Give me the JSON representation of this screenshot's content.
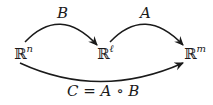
{
  "diagram": {
    "type": "commutative-diagram",
    "nodes": [
      {
        "id": "Rn",
        "base": "ℝ",
        "superscript": "n"
      },
      {
        "id": "Rl",
        "base": "ℝ",
        "superscript": "ℓ"
      },
      {
        "id": "Rm",
        "base": "ℝ",
        "superscript": "m"
      }
    ],
    "edges": [
      {
        "from": "Rn",
        "to": "Rl",
        "label": "B",
        "style": "curved-above"
      },
      {
        "from": "Rl",
        "to": "Rm",
        "label": "A",
        "style": "curved-above"
      },
      {
        "from": "Rn",
        "to": "Rm",
        "label": "C = A ∘ B",
        "style": "curved-below"
      }
    ],
    "colors": {
      "stroke": "#1a1a1a",
      "background": "#ffffff"
    }
  }
}
